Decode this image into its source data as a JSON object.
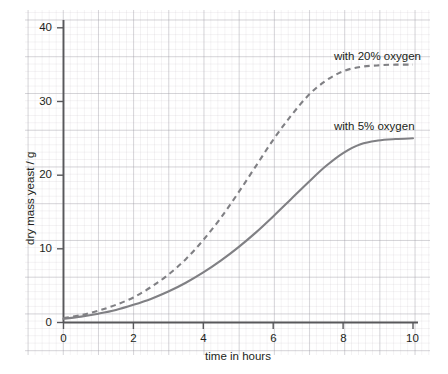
{
  "chart_data": {
    "type": "line",
    "title": "",
    "xlabel": "time in hours",
    "ylabel": "dry mass yeast / g",
    "xlim": [
      0,
      10
    ],
    "ylim": [
      0,
      42
    ],
    "grid": true,
    "grid_style": "graph-paper",
    "legend_position": "inline-annotation",
    "xticks": [
      "0",
      "2",
      "4",
      "6",
      "8",
      "10"
    ],
    "xtick_values": [
      0,
      2,
      4,
      6,
      8,
      10
    ],
    "yticks": [
      "0",
      "10",
      "20",
      "30",
      "40"
    ],
    "ytick_values": [
      0,
      10,
      20,
      30,
      40
    ],
    "x": [
      0,
      0.5,
      1,
      1.5,
      2,
      2.5,
      3,
      3.5,
      4,
      4.5,
      5,
      5.5,
      6,
      6.5,
      7,
      7.5,
      8,
      8.5,
      9,
      9.5,
      10
    ],
    "series": [
      {
        "name": "with 20% oxygen",
        "style": "dashed",
        "color": "#808084",
        "plateau": 35,
        "values": [
          0.6,
          1.0,
          1.6,
          2.4,
          3.4,
          4.8,
          6.5,
          8.6,
          11.2,
          14.2,
          17.6,
          21.2,
          24.8,
          28.0,
          30.8,
          32.8,
          34.1,
          34.7,
          34.9,
          35.0,
          35.0
        ]
      },
      {
        "name": "with 5% oxygen",
        "style": "solid",
        "color": "#808084",
        "plateau": 25,
        "values": [
          0.5,
          0.8,
          1.2,
          1.7,
          2.4,
          3.2,
          4.2,
          5.4,
          6.8,
          8.4,
          10.2,
          12.2,
          14.4,
          16.7,
          19.0,
          21.2,
          23.0,
          24.2,
          24.7,
          24.9,
          25.0
        ]
      }
    ],
    "annotations": [
      {
        "text": "with 20% oxygen",
        "x_px": 334,
        "y_px": 57
      },
      {
        "text": "with 5% oxygen",
        "x_px": 334,
        "y_px": 127
      }
    ],
    "colors": {
      "axis": "#58585b",
      "curve": "#808084",
      "text": "#221f20",
      "grid_major": "#96969f",
      "grid_minor": "#aaa0aa"
    }
  }
}
